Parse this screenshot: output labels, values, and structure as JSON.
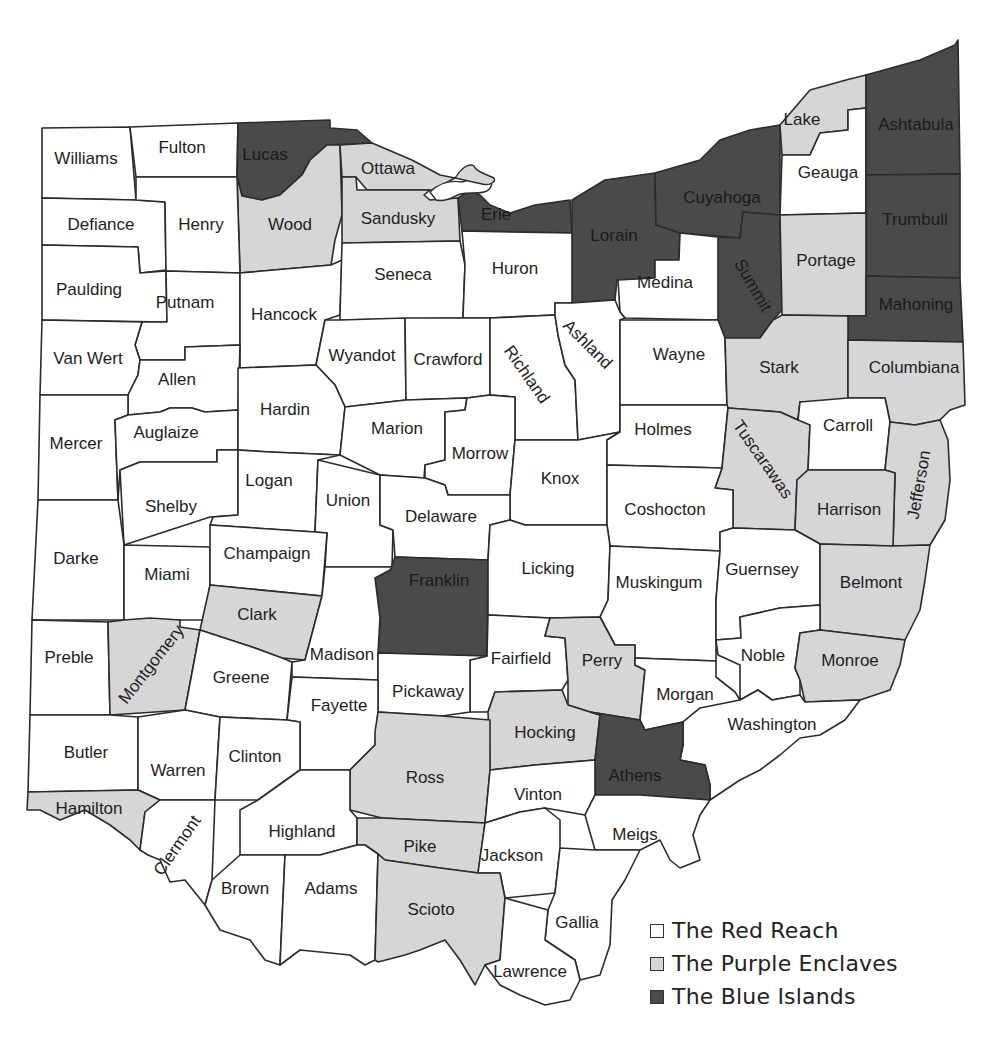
{
  "map": {
    "title": "Ohio counties by political category",
    "colors": {
      "red": "#ffffff",
      "purple": "#d6d6d6",
      "blue": "#4a4a4a",
      "border": "#2b2b2b"
    },
    "counties": [
      {
        "name": "Williams",
        "category": "red"
      },
      {
        "name": "Fulton",
        "category": "red"
      },
      {
        "name": "Lucas",
        "category": "blue"
      },
      {
        "name": "Ottawa",
        "category": "purple"
      },
      {
        "name": "Wood",
        "category": "purple"
      },
      {
        "name": "Sandusky",
        "category": "purple"
      },
      {
        "name": "Erie",
        "category": "blue"
      },
      {
        "name": "Defiance",
        "category": "red"
      },
      {
        "name": "Henry",
        "category": "red"
      },
      {
        "name": "Lorain",
        "category": "blue"
      },
      {
        "name": "Cuyahoga",
        "category": "blue"
      },
      {
        "name": "Lake",
        "category": "purple"
      },
      {
        "name": "Geauga",
        "category": "red"
      },
      {
        "name": "Ashtabula",
        "category": "blue"
      },
      {
        "name": "Trumbull",
        "category": "blue"
      },
      {
        "name": "Summit",
        "category": "blue"
      },
      {
        "name": "Portage",
        "category": "purple"
      },
      {
        "name": "Mahoning",
        "category": "blue"
      },
      {
        "name": "Paulding",
        "category": "red"
      },
      {
        "name": "Putnam",
        "category": "red"
      },
      {
        "name": "Hancock",
        "category": "red"
      },
      {
        "name": "Seneca",
        "category": "red"
      },
      {
        "name": "Huron",
        "category": "red"
      },
      {
        "name": "Medina",
        "category": "red"
      },
      {
        "name": "Van Wert",
        "category": "red"
      },
      {
        "name": "Allen",
        "category": "red"
      },
      {
        "name": "Wyandot",
        "category": "red"
      },
      {
        "name": "Crawford",
        "category": "red"
      },
      {
        "name": "Richland",
        "category": "red"
      },
      {
        "name": "Ashland",
        "category": "red"
      },
      {
        "name": "Wayne",
        "category": "red"
      },
      {
        "name": "Stark",
        "category": "purple"
      },
      {
        "name": "Columbiana",
        "category": "purple"
      },
      {
        "name": "Mercer",
        "category": "red"
      },
      {
        "name": "Auglaize",
        "category": "red"
      },
      {
        "name": "Hardin",
        "category": "red"
      },
      {
        "name": "Marion",
        "category": "red"
      },
      {
        "name": "Morrow",
        "category": "red"
      },
      {
        "name": "Knox",
        "category": "red"
      },
      {
        "name": "Holmes",
        "category": "red"
      },
      {
        "name": "Tuscarawas",
        "category": "purple"
      },
      {
        "name": "Carroll",
        "category": "red"
      },
      {
        "name": "Jefferson",
        "category": "purple"
      },
      {
        "name": "Harrison",
        "category": "purple"
      },
      {
        "name": "Shelby",
        "category": "red"
      },
      {
        "name": "Logan",
        "category": "red"
      },
      {
        "name": "Union",
        "category": "red"
      },
      {
        "name": "Delaware",
        "category": "red"
      },
      {
        "name": "Coshocton",
        "category": "red"
      },
      {
        "name": "Darke",
        "category": "red"
      },
      {
        "name": "Miami",
        "category": "red"
      },
      {
        "name": "Champaign",
        "category": "red"
      },
      {
        "name": "Franklin",
        "category": "blue"
      },
      {
        "name": "Licking",
        "category": "red"
      },
      {
        "name": "Muskingum",
        "category": "red"
      },
      {
        "name": "Guernsey",
        "category": "red"
      },
      {
        "name": "Belmont",
        "category": "purple"
      },
      {
        "name": "Clark",
        "category": "purple"
      },
      {
        "name": "Preble",
        "category": "red"
      },
      {
        "name": "Montgomery",
        "category": "purple"
      },
      {
        "name": "Greene",
        "category": "red"
      },
      {
        "name": "Madison",
        "category": "red"
      },
      {
        "name": "Fairfield",
        "category": "red"
      },
      {
        "name": "Perry",
        "category": "purple"
      },
      {
        "name": "Noble",
        "category": "red"
      },
      {
        "name": "Monroe",
        "category": "purple"
      },
      {
        "name": "Pickaway",
        "category": "red"
      },
      {
        "name": "Fayette",
        "category": "red"
      },
      {
        "name": "Morgan",
        "category": "red"
      },
      {
        "name": "Washington",
        "category": "red"
      },
      {
        "name": "Butler",
        "category": "red"
      },
      {
        "name": "Warren",
        "category": "red"
      },
      {
        "name": "Clinton",
        "category": "red"
      },
      {
        "name": "Hocking",
        "category": "purple"
      },
      {
        "name": "Ross",
        "category": "purple"
      },
      {
        "name": "Athens",
        "category": "blue"
      },
      {
        "name": "Vinton",
        "category": "red"
      },
      {
        "name": "Hamilton",
        "category": "purple"
      },
      {
        "name": "Clermont",
        "category": "red"
      },
      {
        "name": "Highland",
        "category": "red"
      },
      {
        "name": "Pike",
        "category": "purple"
      },
      {
        "name": "Jackson",
        "category": "red"
      },
      {
        "name": "Meigs",
        "category": "red"
      },
      {
        "name": "Brown",
        "category": "red"
      },
      {
        "name": "Adams",
        "category": "red"
      },
      {
        "name": "Scioto",
        "category": "purple"
      },
      {
        "name": "Gallia",
        "category": "red"
      },
      {
        "name": "Lawrence",
        "category": "red"
      }
    ]
  },
  "legend": {
    "items": [
      {
        "label": "The Red Reach",
        "category": "red",
        "color": "#ffffff"
      },
      {
        "label": "The Purple Enclaves",
        "category": "purple",
        "color": "#d6d6d6"
      },
      {
        "label": "The Blue Islands",
        "category": "blue",
        "color": "#4a4a4a"
      }
    ]
  }
}
